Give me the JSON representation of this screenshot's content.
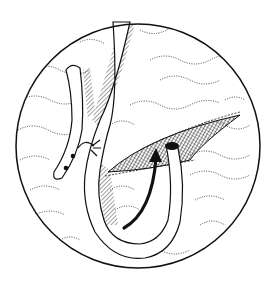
{
  "figure": {
    "kind": "surgical line illustration",
    "colors": {
      "ink": "#111111",
      "background": "#ffffff"
    },
    "elements": [
      "circular-frame",
      "tissue-texture",
      "incision",
      "looped-tube",
      "suture-knot",
      "tube-holes",
      "direction-arrow",
      "hatch-shading"
    ]
  }
}
